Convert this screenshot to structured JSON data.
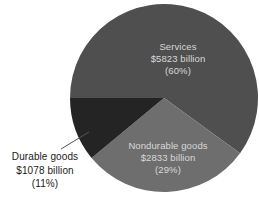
{
  "chart_data": {
    "type": "pie",
    "title": "",
    "categories": [
      "Services",
      "Nondurable goods",
      "Durable goods"
    ],
    "values": [
      5823,
      2833,
      1078
    ],
    "percentages": [
      60,
      29,
      11
    ],
    "unit": "billion",
    "currency": "$",
    "legend": "none",
    "grid": false,
    "start_angle_deg": 180,
    "direction": "clockwise",
    "slices": [
      {
        "name": "Services",
        "value": 5823,
        "percent": 60,
        "color": "#4f4f4f",
        "label_position": "inside",
        "label_lines": [
          "Services",
          "$5823 billion",
          "(60%)"
        ]
      },
      {
        "name": "Nondurable goods",
        "value": 2833,
        "percent": 29,
        "color": "#6e6e6e",
        "label_position": "inside",
        "label_lines": [
          "Nondurable goods",
          "$2833 billion",
          "(29%)"
        ]
      },
      {
        "name": "Durable goods",
        "value": 1078,
        "percent": 11,
        "color": "#242424",
        "label_position": "outside",
        "has_leader_line": true,
        "label_lines": [
          "Durable goods",
          "$1078 billion",
          "(11%)"
        ]
      }
    ]
  },
  "labels": {
    "services": {
      "line1": "Services",
      "line2": "$5823 billion",
      "line3": "(60%)"
    },
    "nondurable": {
      "line1": "Nondurable goods",
      "line2": "$2833 billion",
      "line3": "(29%)"
    },
    "durable": {
      "line1": "Durable goods",
      "line2": "$1078 billion",
      "line3": "(11%)"
    }
  },
  "colors": {
    "services": "#4f4f4f",
    "nondurable": "#6e6e6e",
    "durable": "#242424",
    "background": "#ffffff",
    "inside_text": "#d8d8d8",
    "outside_text": "#1a1a1a",
    "leader_line": "#555555"
  }
}
